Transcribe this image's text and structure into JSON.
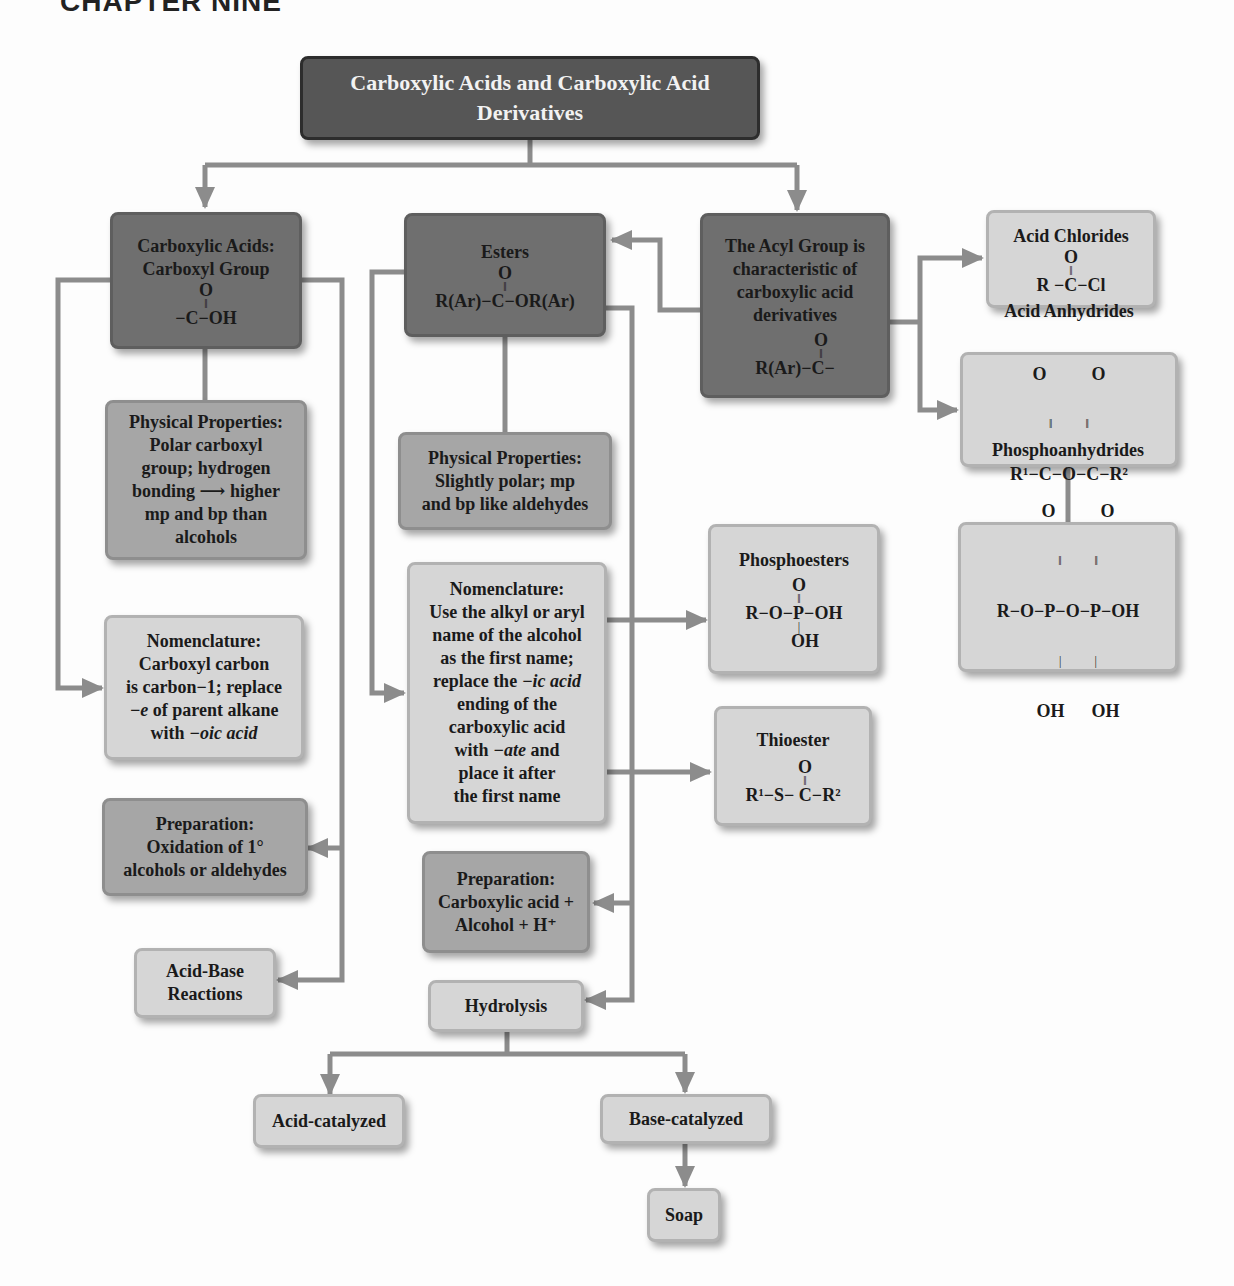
{
  "chapter_heading": "CHAPTER NINE",
  "title": "Carboxylic Acids and Carboxylic Acid Derivatives",
  "colors": {
    "dark_box": "#6f6f6f",
    "mid_box": "#a6a6a6",
    "light_box": "#d6d6d6",
    "title_box": "#565656",
    "connector": "#8c8c8c"
  },
  "carboxylic_acids": {
    "heading_line1": "Carboxylic Acids:",
    "heading_line2": "Carboxyl Group",
    "formula_top": "O",
    "formula_bond": "‖",
    "formula_main": "−C−OH"
  },
  "esters": {
    "heading": "Esters",
    "formula_top": "O",
    "formula_bond": "‖",
    "formula_main": "R(Ar)−C−OR(Ar)"
  },
  "acyl_group": {
    "line1": "The Acyl Group is",
    "line2": "characteristic of",
    "line3": "carboxylic acid",
    "line4": "derivatives",
    "formula_top": "O",
    "formula_bond": "‖",
    "formula_main": "R(Ar)−C−"
  },
  "acid_chlorides": {
    "heading": "Acid Chlorides",
    "formula_top": "O",
    "formula_bond": "‖",
    "formula_main": "R −C−Cl"
  },
  "acid_anhydrides": {
    "heading": "Acid Anhydrides",
    "formula_top": "O          O",
    "formula_bond": "‖           ‖",
    "formula_main": "R¹−C−O−C−R²"
  },
  "phosphoesters": {
    "heading": "Phosphoesters",
    "formula_top": "O",
    "formula_bond": "‖",
    "formula_main": "R−O−P−OH",
    "formula_single": "|",
    "formula_bottom": "OH"
  },
  "phosphoanhydrides": {
    "heading": "Phosphoanhydrides",
    "formula_top": "O          O",
    "formula_bond": "‖           ‖",
    "formula_main": "R−O−P−O−P−OH",
    "formula_single": "|           |",
    "formula_bottom": "OH      OH"
  },
  "thioester": {
    "heading": "Thioester",
    "formula_top": "O",
    "formula_bond": "‖",
    "formula_main": "R¹−S− C−R²"
  },
  "acid_physical": {
    "lines": [
      "Physical Properties:",
      "Polar carboxyl",
      "group; hydrogen",
      "bonding ⟶ higher",
      "mp and bp than",
      "alcohols"
    ]
  },
  "ester_physical": {
    "lines": [
      "Physical Properties:",
      "Slightly polar; mp",
      "and bp like aldehydes"
    ]
  },
  "acid_nomenclature": {
    "line1": "Nomenclature:",
    "line2": "Carboxyl carbon",
    "line3": "is carbon−1; replace",
    "line4_italic": "−e",
    "line4_rest": " of parent alkane",
    "line5_plain": "with ",
    "line5_italic": "−oic acid"
  },
  "ester_nomenclature": {
    "line1": "Nomenclature:",
    "line2": "Use the alkyl or aryl",
    "line3": "name of the alcohol",
    "line4": "as the first name;",
    "line5_plain": "replace the ",
    "line5_italic": "−ic acid",
    "line6": "ending of the",
    "line7": "carboxylic acid",
    "line8_plain": "with ",
    "line8_italic": "−ate",
    "line8_rest": " and",
    "line9": "place it after",
    "line10": "the first name"
  },
  "acid_preparation": {
    "lines": [
      "Preparation:",
      "Oxidation of 1°",
      "alcohols or aldehydes"
    ]
  },
  "ester_preparation": {
    "lines": [
      "Preparation:",
      "Carboxylic acid +",
      "Alcohol + H⁺"
    ]
  },
  "acid_base": {
    "lines": [
      "Acid-Base",
      "Reactions"
    ]
  },
  "hydrolysis": {
    "label": "Hydrolysis"
  },
  "acid_catalyzed": {
    "label": "Acid-catalyzed"
  },
  "base_catalyzed": {
    "label": "Base-catalyzed"
  },
  "soap": {
    "label": "Soap"
  }
}
